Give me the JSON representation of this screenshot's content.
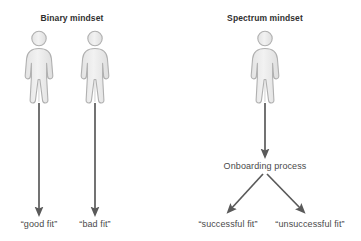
{
  "canvas": {
    "width": 361,
    "height": 241,
    "background": "#ffffff"
  },
  "style": {
    "arrow_color": "#5a5a5a",
    "person_fill": "#ebebeb",
    "person_stroke": "#b4b4b4",
    "text_color": "#4a4a4a",
    "heading_color": "#2f2f2f"
  },
  "diagram": {
    "type": "flow-comparison",
    "panels": [
      {
        "id": "binary",
        "heading": "Binary mindset",
        "heading_x": 72,
        "heading_y": 18,
        "people": [
          {
            "id": "binary-person-good",
            "cx": 39,
            "top": 30
          },
          {
            "id": "binary-person-bad",
            "cx": 95,
            "top": 30
          }
        ],
        "arrows": [
          {
            "id": "binary-arrow-good",
            "x1": 39,
            "y1": 103,
            "x2": 39,
            "y2": 214
          },
          {
            "id": "binary-arrow-bad",
            "x1": 95,
            "y1": 103,
            "x2": 95,
            "y2": 214
          }
        ],
        "outcomes": [
          {
            "id": "outcome-good-fit",
            "label": "“good fit”",
            "x": 39,
            "y": 223
          },
          {
            "id": "outcome-bad-fit",
            "label": "“bad fit”",
            "x": 95,
            "y": 223
          }
        ],
        "process": null
      },
      {
        "id": "spectrum",
        "heading": "Spectrum mindset",
        "heading_x": 265,
        "heading_y": 18,
        "people": [
          {
            "id": "spectrum-person",
            "cx": 265,
            "top": 30
          }
        ],
        "arrows": [
          {
            "id": "spectrum-arrow-to-onboarding",
            "x1": 265,
            "y1": 103,
            "x2": 265,
            "y2": 155
          },
          {
            "id": "spectrum-arrow-successful",
            "x1": 263,
            "y1": 173,
            "x2": 228,
            "y2": 212
          },
          {
            "id": "spectrum-arrow-unsuccessful",
            "x1": 267,
            "y1": 173,
            "x2": 304,
            "y2": 212
          }
        ],
        "process": {
          "id": "onboarding-process",
          "label": "Onboarding process",
          "x": 265,
          "y": 166
        },
        "outcomes": [
          {
            "id": "outcome-successful-fit",
            "label": "“successful fit”",
            "x": 228,
            "y": 223
          },
          {
            "id": "outcome-unsuccessful-fit",
            "label": "“unsuccessful fit”",
            "x": 310,
            "y": 223
          }
        ]
      }
    ]
  },
  "icons": {
    "person": "person-icon",
    "arrow": "arrow-down-icon"
  }
}
